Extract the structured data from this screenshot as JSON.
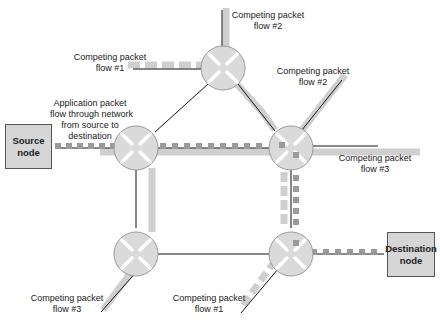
{
  "nodes": {
    "source": {
      "label_line1": "Source",
      "label_line2": "node"
    },
    "destination": {
      "label_line1": "Destination",
      "label_line2": "node"
    }
  },
  "labels": {
    "app_flow": {
      "line1": "Application packet",
      "line2": "flow through network",
      "line3": "from source to",
      "line4": "destination"
    },
    "flow1_top": {
      "line1": "Competing packet",
      "line2": "flow #1"
    },
    "flow2_top": {
      "line1": "Competing packet",
      "line2": "flow #2"
    },
    "flow2_right": {
      "line1": "Competing packet",
      "line2": "flow #2"
    },
    "flow3_right": {
      "line1": "Competing packet",
      "line2": "flow #3"
    },
    "flow3_bottom": {
      "line1": "Competing packet",
      "line2": "flow #3"
    },
    "flow1_bottom": {
      "line1": "Competing packet",
      "line2": "flow #1"
    }
  },
  "colors": {
    "router_fill": "#d9d9d9",
    "router_stroke": "#9a9a9a",
    "flow_band": "#c8c8c8",
    "packet": "#999999",
    "link": "#111111",
    "node_fill": "#d6d6d6"
  }
}
